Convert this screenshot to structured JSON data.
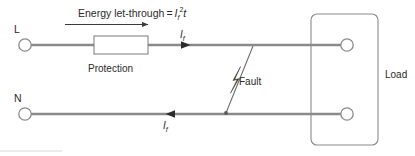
{
  "diagram": {
    "background_color": "#ffffff",
    "wire_color": "#8a8a8a",
    "outline_color": "#8a8a8a",
    "text_color": "#2b2b2b",
    "labels": {
      "energy_prefix": "Energy let-through",
      "energy_equals": "=",
      "energy_symbol_i": "I",
      "energy_symbol_i_sub": "f",
      "energy_symbol_exp": "2",
      "energy_symbol_t": "t",
      "protection": "Protection",
      "fault": "Fault",
      "load": "Load",
      "line_terminal": "L",
      "neutral_terminal": "N",
      "current_symbol": "I",
      "current_symbol_sub": "f"
    }
  }
}
